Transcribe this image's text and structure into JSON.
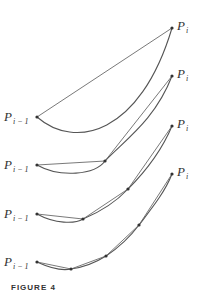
{
  "figure": {
    "caption": "FIGURE 4",
    "label_start": {
      "base": "P",
      "sub": "i − 1"
    },
    "label_end": {
      "base": "P",
      "sub": "i"
    },
    "panels": [
      {
        "name": "one-segment",
        "chord_points": [
          [
            37,
            117
          ],
          [
            172,
            28
          ]
        ],
        "curve_path": "M37,117 C75,150 140,135 172,28"
      },
      {
        "name": "two-segments",
        "chord_points": [
          [
            37,
            165
          ],
          [
            105,
            161
          ],
          [
            172,
            76
          ]
        ],
        "curve_path": "M37,165 C60,178 95,175 105,161 C125,140 155,120 172,76"
      },
      {
        "name": "four-segments",
        "chord_points": [
          [
            37,
            214
          ],
          [
            83,
            219
          ],
          [
            128,
            189
          ],
          [
            172,
            126
          ]
        ],
        "curve_path": "M37,214 C55,224 75,224 83,219 C100,212 115,203 128,189 C145,172 162,150 172,126"
      },
      {
        "name": "eight-segments",
        "chord_points": [
          [
            37,
            262
          ],
          [
            71,
            269
          ],
          [
            106,
            256
          ],
          [
            139,
            225
          ],
          [
            172,
            174
          ]
        ],
        "curve_path": "M37,262 C50,268 62,271 71,269 C85,267 95,263 106,256 C118,248 130,237 139,225 C152,208 165,192 172,174"
      }
    ]
  }
}
